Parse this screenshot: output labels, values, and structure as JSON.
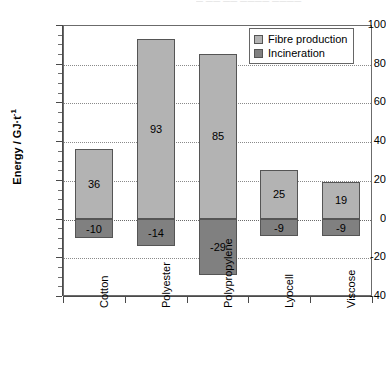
{
  "artifact": {
    "top_text": "— —— —— ———— ————"
  },
  "chart_data": {
    "type": "bar",
    "title": "",
    "subtitle": "",
    "xlabel": "",
    "ylabel": "Energy / GJ·t",
    "ylabel_exponent": "-1",
    "ylim": [
      -40,
      100
    ],
    "yticks": [
      100,
      80,
      60,
      40,
      20,
      0,
      -20,
      -40
    ],
    "ytick_labels": [
      "100",
      "80",
      "60",
      "40",
      "20",
      "0",
      "-20",
      "-40"
    ],
    "grid": "horizontal-dotted",
    "legend_position": "top-right",
    "categories": [
      "Cotton",
      "Polyester",
      "Polypropylene",
      "Lyocell",
      "Viscose"
    ],
    "series": [
      {
        "name": "Fibre production",
        "color": "#b3b3b3",
        "values": [
          36,
          93,
          85,
          25,
          19
        ]
      },
      {
        "name": "Incineration",
        "color": "#808080",
        "values": [
          -10,
          -14,
          -29,
          -9,
          -9
        ]
      }
    ],
    "data_labels": {
      "Cotton": {
        "fibre_production": "36",
        "incineration": "-10"
      },
      "Polyester": {
        "fibre_production": "93",
        "incineration": "-14"
      },
      "Polypropylene": {
        "fibre_production": "85",
        "incineration": "-29"
      },
      "Lyocell": {
        "fibre_production": "25",
        "incineration": "-9"
      },
      "Viscose": {
        "fibre_production": "19",
        "incineration": "-9"
      }
    }
  }
}
